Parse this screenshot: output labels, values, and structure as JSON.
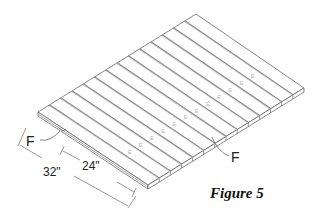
{
  "figure": {
    "caption": "Figure 5",
    "board_count": 14,
    "labels": {
      "fastener_left": "F",
      "fastener_right": "F",
      "edge_mark": "E"
    },
    "dimensions": {
      "overall": "32\"",
      "inner": "24\""
    },
    "colors": {
      "line": "#555555",
      "gap": "#8a8a8a",
      "mark": "#b8b8b8",
      "text": "#222222"
    }
  }
}
